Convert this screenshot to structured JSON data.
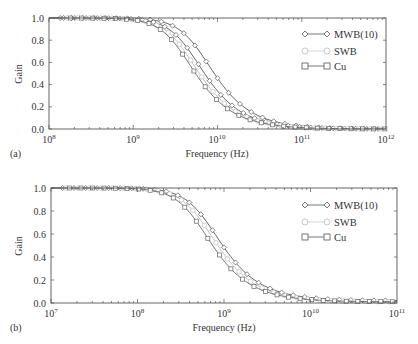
{
  "chart_data": [
    {
      "panel": "(a)",
      "type": "line",
      "xlabel": "Frequency (Hz)",
      "ylabel": "Gain",
      "xscale": "log",
      "xlim": [
        100000000.0,
        1000000000000.0
      ],
      "ylim": [
        0.0,
        1.0
      ],
      "x_ticks": [
        "10^8",
        "10^9",
        "10^10",
        "10^11",
        "10^12"
      ],
      "y_ticks": [
        "0.0",
        "0.2",
        "0.4",
        "0.6",
        "0.8",
        "1.0"
      ],
      "legend_position": "upper right",
      "series": [
        {
          "name": "MWB(10)",
          "marker": "diamond",
          "color": "#555555",
          "f3db_hz": 6000000000.0,
          "x": [
            100000000.0,
            1000000000.0,
            2000000000.0,
            5000000000.0,
            10000000000.0,
            20000000000.0,
            50000000000.0,
            100000000000.0,
            1000000000000.0
          ],
          "values": [
            1.0,
            0.95,
            0.85,
            0.55,
            0.32,
            0.14,
            0.04,
            0.01,
            0.0
          ]
        },
        {
          "name": "MWB(10)",
          "marker": "diamond",
          "color": "#555555",
          "f3db_hz": 4600000000.0,
          "x": [
            100000000.0,
            1000000000.0,
            2000000000.0,
            5000000000.0,
            10000000000.0,
            20000000000.0,
            50000000000.0,
            100000000000.0,
            1000000000000.0
          ],
          "values": [
            1.0,
            0.94,
            0.8,
            0.47,
            0.25,
            0.1,
            0.03,
            0.01,
            0.0
          ]
        },
        {
          "name": "SWB",
          "marker": "circle",
          "color": "#bbbbbb",
          "f3db_hz": 4000000000.0,
          "x": [
            100000000.0,
            1000000000.0,
            2000000000.0,
            5000000000.0,
            10000000000.0,
            20000000000.0,
            50000000000.0,
            100000000000.0,
            1000000000000.0
          ],
          "values": [
            1.0,
            0.93,
            0.77,
            0.42,
            0.22,
            0.09,
            0.02,
            0.01,
            0.0
          ]
        },
        {
          "name": "Cu",
          "marker": "square",
          "color": "#666666",
          "f3db_hz": 3600000000.0,
          "x": [
            100000000.0,
            1000000000.0,
            2000000000.0,
            5000000000.0,
            10000000000.0,
            20000000000.0,
            50000000000.0,
            100000000000.0,
            1000000000000.0
          ],
          "values": [
            1.0,
            0.92,
            0.74,
            0.38,
            0.19,
            0.07,
            0.02,
            0.0,
            0.0
          ]
        }
      ]
    },
    {
      "panel": "(b)",
      "type": "line",
      "xlabel": "Frequency (Hz)",
      "ylabel": "Gain",
      "xscale": "log",
      "xlim": [
        10000000.0,
        100000000000.0
      ],
      "ylim": [
        0.0,
        1.0
      ],
      "x_ticks": [
        "10^7",
        "10^8",
        "10^9",
        "10^10",
        "10^11"
      ],
      "y_ticks": [
        "0.0",
        "0.2",
        "0.4",
        "0.6",
        "0.8",
        "1.0"
      ],
      "legend_position": "upper right",
      "series": [
        {
          "name": "MWB(10)",
          "marker": "diamond",
          "color": "#555555",
          "f3db_hz": 620000000.0,
          "x": [
            10000000.0,
            100000000.0,
            200000000.0,
            500000000.0,
            1000000000.0,
            2000000000.0,
            5000000000.0,
            10000000000.0,
            100000000000.0
          ],
          "values": [
            1.0,
            0.95,
            0.86,
            0.56,
            0.34,
            0.16,
            0.06,
            0.04,
            0.03
          ]
        },
        {
          "name": "SWB",
          "marker": "circle",
          "color": "#bbbbbb",
          "f3db_hz": 550000000.0,
          "x": [
            10000000.0,
            100000000.0,
            200000000.0,
            500000000.0,
            1000000000.0,
            2000000000.0,
            5000000000.0,
            10000000000.0,
            100000000000.0
          ],
          "values": [
            1.0,
            0.94,
            0.83,
            0.52,
            0.3,
            0.13,
            0.04,
            0.02,
            0.02
          ]
        },
        {
          "name": "Cu",
          "marker": "square",
          "color": "#666666",
          "f3db_hz": 480000000.0,
          "x": [
            10000000.0,
            100000000.0,
            200000000.0,
            500000000.0,
            1000000000.0,
            2000000000.0,
            5000000000.0,
            10000000000.0,
            100000000000.0
          ],
          "values": [
            1.0,
            0.93,
            0.8,
            0.47,
            0.26,
            0.1,
            0.02,
            0.01,
            0.0
          ]
        }
      ]
    }
  ],
  "panels": [
    {
      "label": "(a)",
      "ylabel": "Gain",
      "xlabel": "Frequency (Hz)",
      "y_ticks": [
        "0.0",
        "0.2",
        "0.4",
        "0.6",
        "0.8",
        "1.0"
      ],
      "x_tick_bases": [
        "10",
        "10",
        "10",
        "10",
        "10"
      ],
      "x_tick_exps": [
        "8",
        "9",
        "10",
        "11",
        "12"
      ],
      "legend": [
        "MWB(10)",
        "SWB",
        "Cu"
      ]
    },
    {
      "label": "(b)",
      "ylabel": "Gain",
      "xlabel": "Frequency (Hz)",
      "y_ticks": [
        "0.0",
        "0.2",
        "0.4",
        "0.6",
        "0.8",
        "1.0"
      ],
      "x_tick_bases": [
        "10",
        "10",
        "10",
        "10",
        "10"
      ],
      "x_tick_exps": [
        "7",
        "8",
        "9",
        "10",
        "11"
      ],
      "legend": [
        "MWB(10)",
        "SWB",
        "Cu"
      ]
    }
  ]
}
